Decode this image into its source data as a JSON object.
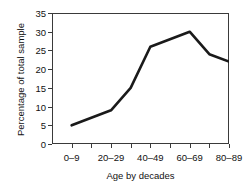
{
  "chart_data": {
    "type": "line",
    "title": "",
    "xlabel": "Age by decades",
    "ylabel": "Percentage of total sample",
    "xlim": [
      0,
      9
    ],
    "ylim": [
      0,
      35
    ],
    "grid": false,
    "legend": "none",
    "line_color": "#1a1a1a",
    "categories": [
      "0–9",
      "10–19",
      "20–29",
      "30–39",
      "40–49",
      "50–59",
      "60–69",
      "70–79",
      "80–89"
    ],
    "tick_labels_shown": [
      "0–9",
      "",
      "20–29",
      "",
      "40–49",
      "",
      "60–69",
      "",
      "80–89"
    ],
    "x": [
      1,
      2,
      3,
      4,
      5,
      6,
      7,
      8,
      9
    ],
    "values": [
      5,
      7,
      9,
      15,
      26,
      28,
      30,
      24,
      22
    ],
    "yticks": [
      0,
      5,
      10,
      15,
      20,
      25,
      30,
      35
    ],
    "ytick_labels": [
      "0",
      "5",
      "10",
      "15",
      "20",
      "25",
      "30",
      "35"
    ]
  },
  "axis": {
    "y_label": "Percentage of total sample",
    "x_label": "Age by decades"
  }
}
